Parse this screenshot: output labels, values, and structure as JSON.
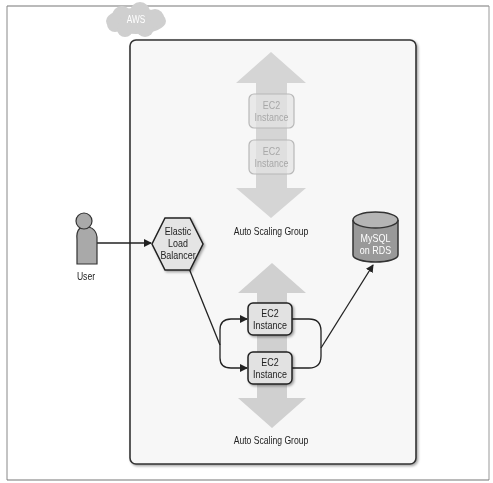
{
  "diagram": {
    "cloud_label": "AWS",
    "user": {
      "label": "User"
    },
    "load_balancer": {
      "line1": "Elastic",
      "line2": "Load",
      "line3": "Balancer"
    },
    "database": {
      "line1": "MySQL",
      "line2": "on RDS"
    },
    "scaling_groups": [
      {
        "label": "Auto Scaling Group",
        "state": "inactive",
        "instances": [
          {
            "line1": "EC2",
            "line2": "Instance"
          },
          {
            "line1": "EC2",
            "line2": "Instance"
          }
        ]
      },
      {
        "label": "Auto Scaling Group",
        "state": "active",
        "instances": [
          {
            "line1": "EC2",
            "line2": "Instance"
          },
          {
            "line1": "EC2",
            "line2": "Instance"
          }
        ]
      }
    ],
    "colors": {
      "frame": "#777777",
      "aws_box_fill": "#f7f7f7",
      "aws_box_stroke": "#333333",
      "cloud": "#cfcfcf",
      "scaling_arrow": "#d0d0d0",
      "instance_fill": "#e2e2e2",
      "faded_instance_stroke": "#b5b5b5",
      "user_fill": "#a9a9a9",
      "db_fill": "#9a9a9a",
      "hexagon_fill": "#e4e4e4"
    }
  }
}
